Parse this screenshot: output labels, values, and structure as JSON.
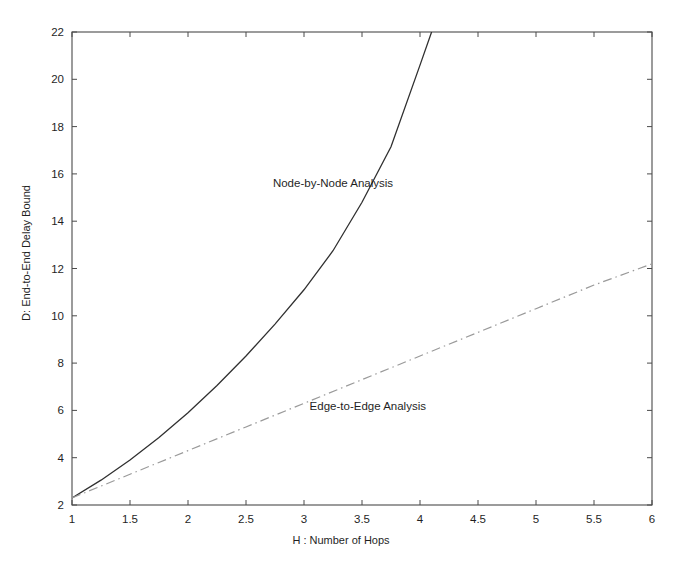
{
  "chart_data": {
    "type": "line",
    "title": "",
    "xlabel": "H : Number of Hops",
    "ylabel": "D: End-to-End Delay Bound",
    "xlim": [
      1,
      6
    ],
    "ylim": [
      2,
      22
    ],
    "grid": false,
    "legend_position": "inline-annotations",
    "xticks": [
      "1",
      "1.5",
      "2",
      "2.5",
      "3",
      "3.5",
      "4",
      "4.5",
      "5",
      "5.5",
      "6"
    ],
    "xtick_values": [
      1,
      1.5,
      2,
      2.5,
      3,
      3.5,
      4,
      4.5,
      5,
      5.5,
      6
    ],
    "yticks": [
      "2",
      "4",
      "6",
      "8",
      "10",
      "12",
      "14",
      "16",
      "18",
      "20",
      "22"
    ],
    "ytick_values": [
      2,
      4,
      6,
      8,
      10,
      12,
      14,
      16,
      18,
      20,
      22
    ],
    "series": [
      {
        "name": "Node-by-Node Analysis",
        "style": "solid",
        "color": "#303030",
        "annotation": "Node-by-Node Analysis",
        "annotation_x": 3.25,
        "annotation_y": 15.6,
        "x": [
          1,
          1.25,
          1.5,
          1.75,
          2,
          2.25,
          2.5,
          2.75,
          3,
          3.25,
          3.5,
          3.75,
          4,
          4.1
        ],
        "y": [
          2.3,
          3.05,
          3.9,
          4.85,
          5.9,
          7.05,
          8.3,
          9.65,
          11.1,
          12.75,
          14.8,
          17.15,
          20.6,
          22
        ]
      },
      {
        "name": "Edge-to-Edge Analysis",
        "style": "dash-dot",
        "color": "#9a9a9a",
        "annotation": "Edge-to-Edge Analysis",
        "annotation_x": 3.55,
        "annotation_y": 6.2,
        "x": [
          1,
          1.5,
          2,
          2.5,
          3,
          3.5,
          4,
          4.5,
          5,
          5.5,
          6
        ],
        "y": [
          2.3,
          3.3,
          4.3,
          5.3,
          6.3,
          7.3,
          8.3,
          9.3,
          10.3,
          11.3,
          12.2
        ]
      }
    ]
  },
  "plot_box": {
    "left": 72,
    "top": 32,
    "right": 652,
    "bottom": 505
  }
}
